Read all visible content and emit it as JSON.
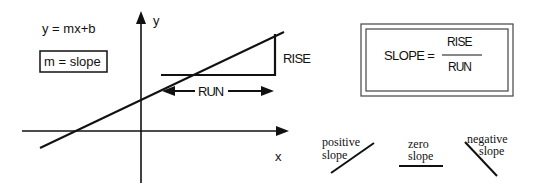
{
  "equation": "y = mx+b",
  "m_definition": "m = slope",
  "axes": {
    "y_label": "y",
    "x_label": "x"
  },
  "triangle": {
    "rise_label": "RISE",
    "run_label": "RUN"
  },
  "formula": {
    "lhs": "SLOPE =",
    "numerator": "RISE",
    "denominator": "RUN"
  },
  "slope_types": [
    {
      "line1": "positive",
      "line2": "slope"
    },
    {
      "line1": "zero",
      "line2": "slope"
    },
    {
      "line1": "negative",
      "line2": "slope"
    }
  ],
  "colors": {
    "ink": "#111111",
    "background": "#ffffff"
  }
}
